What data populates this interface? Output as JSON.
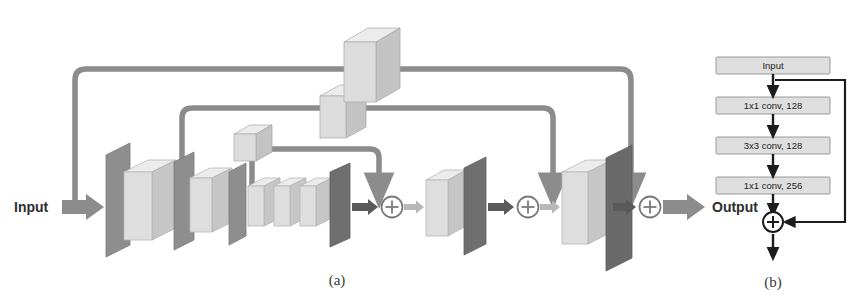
{
  "figure": {
    "panel_a": {
      "caption": "(a)",
      "input_label": "Input",
      "output_label": "Output",
      "merge_symbol": "+",
      "merge_count": 3,
      "encoder_stages": 4,
      "bottleneck_blocks": 3,
      "decoder_stages": 3,
      "skip_cubes": 3
    },
    "panel_b": {
      "caption": "(b)",
      "merge_symbol": "+",
      "blocks": [
        {
          "label": "Input"
        },
        {
          "label": "1x1 conv, 128"
        },
        {
          "label": "3x3 conv, 128"
        },
        {
          "label": "1x1 conv, 256"
        }
      ]
    }
  },
  "colors": {
    "feature_map_dark": "#7c7c7c",
    "feature_map_mid": "#9a9a9a",
    "block_light_face": "#dcdcdc",
    "block_light_top": "#efefef",
    "block_light_side": "#c3c3c3",
    "connector_gray": "#8c8c8c",
    "arrow_dark": "#5a5a5a",
    "box_fill_b": "#dedede",
    "line_b": "#1c1c1c",
    "background": "#ffffff"
  }
}
